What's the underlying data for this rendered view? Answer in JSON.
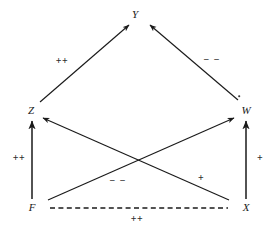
{
  "diagram": {
    "type": "causal-path-diagram",
    "background_color": "#ffffff",
    "stroke_color": "#1a1a1a",
    "nodes": [
      {
        "id": "Y",
        "label": "Y",
        "x": 135,
        "y": 14
      },
      {
        "id": "Z",
        "label": "Z",
        "x": 31,
        "y": 110
      },
      {
        "id": "W",
        "label": "W",
        "x": 246,
        "y": 110
      },
      {
        "id": "F",
        "label": "F",
        "x": 32,
        "y": 207
      },
      {
        "id": "X",
        "label": "X",
        "x": 246,
        "y": 207
      }
    ],
    "edges": [
      {
        "id": "z-to-y",
        "from": "Z",
        "to": "Y",
        "style": "solid",
        "arrow": "to",
        "sign": "++",
        "label_x": 62,
        "label_y": 61,
        "x1": 40,
        "y1": 102,
        "x2": 129,
        "y2": 25
      },
      {
        "id": "w-to-y",
        "from": "W",
        "to": "Y",
        "style": "solid",
        "arrow": "to",
        "sign": "− −",
        "label_x": 212,
        "label_y": 60,
        "x1": 238,
        "y1": 100,
        "x2": 150,
        "y2": 25
      },
      {
        "id": "f-to-z",
        "from": "F",
        "to": "Z",
        "style": "solid",
        "arrow": "to",
        "sign": "++",
        "label_x": 19,
        "label_y": 158,
        "x1": 32,
        "y1": 199,
        "x2": 32,
        "y2": 120
      },
      {
        "id": "x-to-w",
        "from": "X",
        "to": "W",
        "style": "solid",
        "arrow": "to",
        "sign": "+",
        "label_x": 260,
        "label_y": 158,
        "x1": 246,
        "y1": 199,
        "x2": 246,
        "y2": 120
      },
      {
        "id": "f-to-w",
        "from": "F",
        "to": "W",
        "style": "solid",
        "arrow": "to",
        "sign": "+",
        "label_x": 201,
        "label_y": 178,
        "x1": 48,
        "y1": 200,
        "x2": 234,
        "y2": 118
      },
      {
        "id": "x-to-z",
        "from": "X",
        "to": "Z",
        "style": "solid",
        "arrow": "to",
        "sign": "− −",
        "label_x": 118,
        "label_y": 181,
        "x1": 229,
        "y1": 200,
        "x2": 43,
        "y2": 118
      },
      {
        "id": "f-x-association",
        "from": "F",
        "to": "X",
        "style": "dashed",
        "arrow": "none",
        "sign": "++",
        "label_x": 137,
        "label_y": 219,
        "x1": 50,
        "y1": 208,
        "x2": 228,
        "y2": 208
      }
    ],
    "artifacts": [
      {
        "id": "speck-near-w",
        "x": 239,
        "y": 96
      }
    ]
  }
}
